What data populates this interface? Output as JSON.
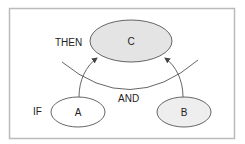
{
  "diagram": {
    "type": "logic-flow",
    "frame": {
      "x": 9,
      "y": 8,
      "width": 225,
      "height": 131,
      "stroke": "#bbbbbb"
    },
    "nodes": [
      {
        "id": "C",
        "label": "C",
        "cx": 131,
        "cy": 41,
        "rx": 41,
        "ry": 21,
        "fill": "#e4e4e4"
      },
      {
        "id": "A",
        "label": "A",
        "cx": 78,
        "cy": 112,
        "rx": 27,
        "ry": 15,
        "fill": "#ffffff"
      },
      {
        "id": "B",
        "label": "B",
        "cx": 184,
        "cy": 112,
        "rx": 27,
        "ry": 15,
        "fill": "#eeeeee"
      }
    ],
    "labels": {
      "then": "THEN",
      "if": "IF",
      "and": "AND"
    },
    "edges": [
      {
        "from": "A",
        "to": "C"
      },
      {
        "from": "B",
        "to": "C"
      }
    ],
    "and_arc": {
      "description": "arc crossing both edges, indicating conjunction"
    },
    "colors": {
      "stroke": "#555555",
      "text": "#222222"
    }
  }
}
